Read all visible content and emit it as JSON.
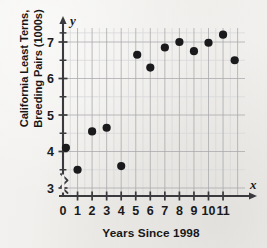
{
  "chart_data": {
    "type": "scatter",
    "title": "",
    "xlabel": "Years Since 1998",
    "ylabel_line1": "California Least Terns,",
    "ylabel_line2": "Breeding Pairs (1000s)",
    "ylabel": "California Least Terns, Breeding Pairs (1000s)",
    "x_axis_variable": "x",
    "y_axis_variable": "y",
    "xlim": [
      0,
      12
    ],
    "ylim": [
      2.55,
      7.6
    ],
    "y_axis_broken": true,
    "y_break_symbol": "zigzag",
    "xticks": [
      0,
      1,
      2,
      3,
      4,
      5,
      6,
      7,
      8,
      9,
      10,
      11
    ],
    "xtick_labels": [
      "0",
      "1",
      "2",
      "3",
      "4",
      "5",
      "6",
      "7",
      "8",
      "9",
      "10",
      "11"
    ],
    "yticks": [
      3,
      4,
      5,
      6,
      7
    ],
    "ytick_labels": [
      "3",
      "4",
      "5",
      "6",
      "7"
    ],
    "y_minor_ticks": [
      3.5,
      4.5,
      5.5,
      6.5
    ],
    "grid": true,
    "grid_major_color": "#a9a9ad",
    "grid_minor_color": "#d8d8da",
    "axis_color": "#3a3a3e",
    "point_color": "#1a1a1c",
    "point_radius": 4.1,
    "legend": "none",
    "x": [
      0.2,
      1,
      2,
      3,
      4,
      5.1,
      6,
      7,
      8,
      9,
      10,
      11,
      11.8
    ],
    "y": [
      4.1,
      3.5,
      4.55,
      4.65,
      3.6,
      6.65,
      6.3,
      6.85,
      7.0,
      6.75,
      6.98,
      7.2,
      6.5
    ],
    "points": [
      {
        "x": 0.2,
        "y": 4.1
      },
      {
        "x": 1,
        "y": 3.5
      },
      {
        "x": 2,
        "y": 4.55
      },
      {
        "x": 3,
        "y": 4.65
      },
      {
        "x": 4,
        "y": 3.6
      },
      {
        "x": 5.1,
        "y": 6.65
      },
      {
        "x": 6,
        "y": 6.3
      },
      {
        "x": 7,
        "y": 6.85
      },
      {
        "x": 8,
        "y": 7.0
      },
      {
        "x": 9,
        "y": 6.75
      },
      {
        "x": 10,
        "y": 6.98
      },
      {
        "x": 11,
        "y": 7.2
      },
      {
        "x": 11.8,
        "y": 6.5
      }
    ]
  }
}
